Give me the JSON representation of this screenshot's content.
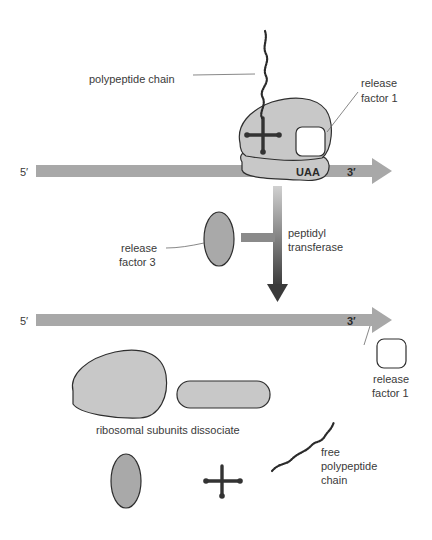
{
  "diagram": {
    "type": "translation-termination",
    "colors": {
      "mrna": "#a8a8a8",
      "ribosome": "#c8c8c8",
      "release_factor_3": "#a9a9a9",
      "release_factor_1": "#ffffff",
      "trna": "#333333",
      "text": "#3a3a3a"
    },
    "top_panel": {
      "mrna_5prime": "5′",
      "mrna_3prime": "3′",
      "stop_codon": "UAA",
      "label_polypeptide": "polypeptide chain",
      "label_rf1_line1": "release",
      "label_rf1_line2": "factor 1"
    },
    "middle": {
      "label_rf3_line1": "release",
      "label_rf3_line2": "factor 3",
      "label_enzyme_line1": "peptidyl",
      "label_enzyme_line2": "transferase"
    },
    "bottom_panel": {
      "mrna_5prime": "5′",
      "mrna_3prime": "3′",
      "label_rf1_line1": "release",
      "label_rf1_line2": "factor 1",
      "label_subunits": "ribosomal subunits dissociate",
      "label_free_chain_line1": "free",
      "label_free_chain_line2": "polypeptide",
      "label_free_chain_line3": "chain"
    }
  }
}
